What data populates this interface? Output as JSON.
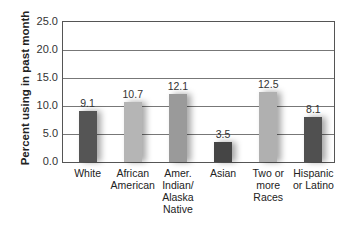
{
  "chart_data": {
    "type": "bar",
    "title": "",
    "xlabel": "",
    "ylabel": "Percent using in past month",
    "ylim": [
      0,
      25
    ],
    "yticks": [
      "0.0",
      "5.0",
      "10.0",
      "15.0",
      "20.0",
      "25.0"
    ],
    "grid": true,
    "categories": [
      "White",
      "African American",
      "Amer. Indian/ Alaska Native",
      "Asian",
      "Two or more Races",
      "Hispanic or Latino"
    ],
    "category_lines": [
      [
        "White"
      ],
      [
        "African",
        "American"
      ],
      [
        "Amer.",
        "Indian/",
        "Alaska",
        "Native"
      ],
      [
        "Asian"
      ],
      [
        "Two or",
        "more",
        "Races"
      ],
      [
        "Hispanic",
        "or Latino"
      ]
    ],
    "values": [
      9.1,
      10.7,
      12.1,
      3.5,
      12.5,
      8.1
    ],
    "value_labels": [
      "9.1",
      "10.7",
      "12.1",
      "3.5",
      "12.5",
      "8.1"
    ],
    "colors": [
      "#555555",
      "#b5b5b5",
      "#9a9a9a",
      "#454545",
      "#b0b0b0",
      "#505050"
    ]
  }
}
